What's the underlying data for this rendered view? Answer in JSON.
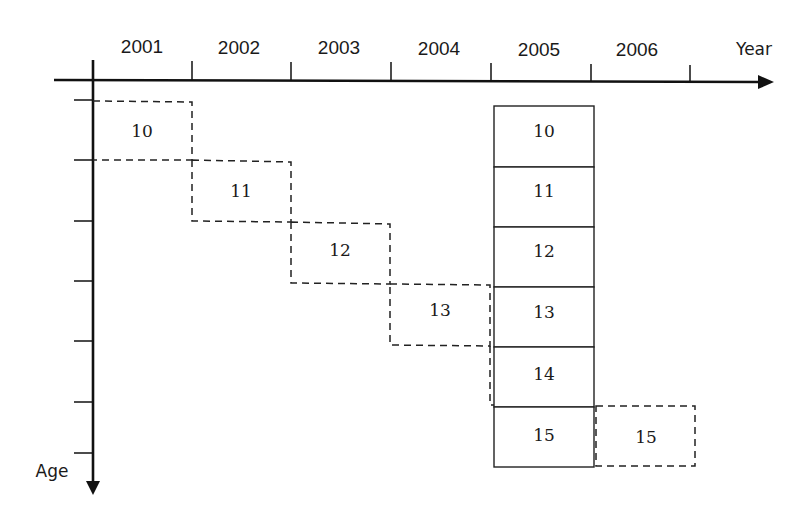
{
  "diagram": {
    "type": "lexis-cohort-diagram",
    "x_axis": {
      "label": "Year",
      "ticks": [
        "2001",
        "2002",
        "2003",
        "2004",
        "2005",
        "2006"
      ]
    },
    "y_axis": {
      "label": "Age"
    },
    "cohort_path": {
      "style": "dashed",
      "cells": [
        {
          "year": "2001",
          "age": "10"
        },
        {
          "year": "2002",
          "age": "11"
        },
        {
          "year": "2003",
          "age": "12"
        },
        {
          "year": "2004",
          "age": "13"
        },
        {
          "year": "2006",
          "age": "15"
        }
      ]
    },
    "cross_section": {
      "style": "solid",
      "year": "2005",
      "ages": [
        "10",
        "11",
        "12",
        "13",
        "14",
        "15"
      ]
    },
    "colors": {
      "line": "#111111",
      "text": "#1a1a1a",
      "background": "#ffffff"
    }
  }
}
